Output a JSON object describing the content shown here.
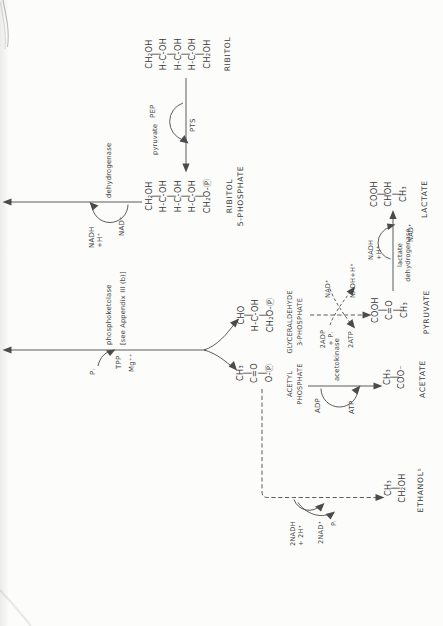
{
  "figure": {
    "molecules": {
      "ribitol": {
        "formula": [
          "CH₂OH",
          "|",
          "H-C-OH",
          "|",
          "H-C-OH",
          "|",
          "H-C-OH",
          "|",
          "CH₂OH"
        ],
        "label": "RIBITOL"
      },
      "ribitol_5_phosphate": {
        "formula": [
          "CH₂OH",
          "|",
          "H-C-OH",
          "|",
          "H-C-OH",
          "|",
          "H-C-OH",
          "|",
          "CH₂O-Ⓟ"
        ],
        "label": [
          "RIBITOL",
          "5-PHOSPHATE"
        ]
      },
      "glyceraldehyde_3_phosphate": {
        "formula": [
          "CHO",
          "|",
          "H-C-OH",
          "|",
          "CH₂O-Ⓟ"
        ],
        "label": [
          "GLYCERALDEHYDE",
          "3-PHOSPHATE"
        ]
      },
      "acetyl_phosphate": {
        "formula": [
          "CH₃",
          "|",
          "C=O",
          "|",
          "O-Ⓟ"
        ],
        "label": [
          "ACETYL",
          "PHOSPHATE"
        ]
      },
      "pyruvate": {
        "formula": [
          "COOH",
          "|",
          "C=O",
          "|",
          "CH₃"
        ],
        "label": "PYRUVATE"
      },
      "lactate": {
        "formula": [
          "COOH",
          "|",
          "CHOH",
          "|",
          "CH₃"
        ],
        "label": "LACTATE"
      },
      "acetate": {
        "formula": [
          "CH₃",
          "|",
          "COO⁻"
        ],
        "label": "ACETATE"
      },
      "ethanol": {
        "formula": [
          "CH₃",
          "|",
          "CH₂OH"
        ],
        "label": "ETHANOLᵇ"
      }
    },
    "reactions": {
      "pts": {
        "enzyme": "PTS",
        "donor_in": "PEP",
        "donor_out": "pyruvate"
      },
      "r5p_dehydrogenase": {
        "enzyme": "dehydrogenase",
        "nad_in": "NAD⁺",
        "nadh_out": [
          "NADH",
          "+H⁺"
        ]
      },
      "phosphoketolase": {
        "enzyme": "phosphoketolase",
        "note": "[see Appendix III (b)]",
        "phosphate_in": "Pᵢ",
        "cofactor_tpp": "TPP",
        "cofactor_mg": "Mg⁺⁺"
      },
      "g3p_to_pyruvate": {
        "adp_in": [
          "2ADP",
          "+ Pᵢ"
        ],
        "atp_out": "2ATP",
        "nad_in": "NAD⁺",
        "nadh_out": "NADH+H⁺"
      },
      "acetokinase": {
        "enzyme": "acetokinase",
        "adp_in": "ADP",
        "atp_out": "ATP"
      },
      "lactate_dehydrogenase": {
        "enzyme": [
          "lactate",
          "dehydrogenase"
        ],
        "nadh_in": [
          "NADH",
          "+H⁺"
        ],
        "nad_out": "NAD⁺"
      },
      "acetylp_to_ethanol": {
        "nadh_in": [
          "2NADH",
          "+ 2H⁺"
        ],
        "nad_out": "2NAD⁺",
        "pi_out": "Pᵢ"
      }
    },
    "ink_color": "#474747"
  }
}
